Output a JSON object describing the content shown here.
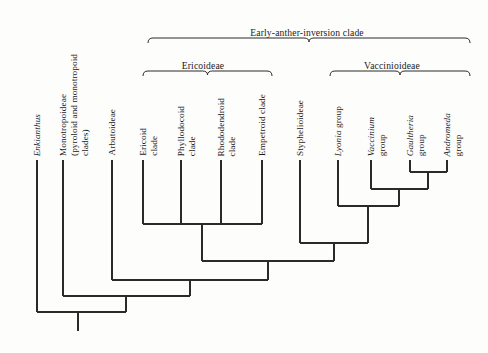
{
  "figure": {
    "kind": "cladogram",
    "background_color": "#fdfdfc",
    "line_color": "#2a2a2a",
    "text_color": "#1a1a1a",
    "width": 488,
    "height": 353
  },
  "clade_brackets": [
    {
      "id": "early-anther-inversion-clade",
      "label": "Early-anther-inversion clade",
      "label_x": 307,
      "label_y": 27,
      "bracket_left": 148,
      "bracket_right": 470,
      "bracket_y": 38,
      "bracket_depth": 5
    },
    {
      "id": "ericoideae",
      "label": "Ericoideae",
      "label_x": 203,
      "label_y": 60,
      "bracket_left": 143,
      "bracket_right": 272,
      "bracket_y": 71,
      "bracket_depth": 5
    },
    {
      "id": "vaccinioideae",
      "label": "Vaccinioideae",
      "label_x": 392,
      "label_y": 60,
      "bracket_left": 330,
      "bracket_right": 470,
      "bracket_y": 71,
      "bracket_depth": 5
    }
  ],
  "tips": [
    {
      "id": "enkianthus",
      "label": "Enkianthus",
      "italic": true,
      "x": 37,
      "label_bottom": 156,
      "lines": [
        "Enkianthus"
      ]
    },
    {
      "id": "monotropoideae",
      "label": "Monotropoideae (pyroloid and monotropoid clades)",
      "italic": false,
      "x": 63,
      "label_bottom": 156,
      "lines": [
        "Monotropoideae",
        "(pyroloid and monotropoid",
        "clades)"
      ]
    },
    {
      "id": "arbutoideae",
      "label": "Arbutoideae",
      "italic": false,
      "x": 112,
      "label_bottom": 156,
      "lines": [
        "Arbutoideae"
      ]
    },
    {
      "id": "ericoid-clade",
      "label": "Ericoid clade",
      "italic": false,
      "x": 143,
      "label_bottom": 156,
      "lines": [
        "Ericoid",
        "clade"
      ]
    },
    {
      "id": "phyllodocoid-clade",
      "label": "Phyllodocoid clade",
      "italic": false,
      "x": 181,
      "label_bottom": 156,
      "lines": [
        "Phyllodocoid",
        "clade"
      ]
    },
    {
      "id": "rhododendroid-clade",
      "label": "Rhododendroid clade",
      "italic": false,
      "x": 221,
      "label_bottom": 156,
      "lines": [
        "Rhododendroid",
        "clade"
      ]
    },
    {
      "id": "empetroid-clade",
      "label": "Empetroid clade",
      "italic": false,
      "x": 262,
      "label_bottom": 156,
      "lines": [
        "Empetroid clade"
      ]
    },
    {
      "id": "styphelioideae",
      "label": "Styphelioideae",
      "italic": false,
      "x": 300,
      "label_bottom": 156,
      "lines": [
        "Styphelioideae"
      ]
    },
    {
      "id": "lyonia-group",
      "label": "Lyonia group",
      "italic": false,
      "italic_prefix": "Lyonia",
      "x": 338,
      "label_bottom": 156,
      "lines": [
        "Lyonia group"
      ]
    },
    {
      "id": "vaccinium-group",
      "label": "Vaccinium group",
      "italic": false,
      "italic_prefix": "Vaccinium",
      "x": 371,
      "label_bottom": 156,
      "lines": [
        "Vaccinium",
        "group"
      ]
    },
    {
      "id": "gaultheria-group",
      "label": "Gaultheria group",
      "italic": false,
      "italic_prefix": "Gaultheria",
      "x": 410,
      "label_bottom": 156,
      "lines": [
        "Gaultheria",
        "group"
      ]
    },
    {
      "id": "andromeda-group",
      "label": "Andromeda group",
      "italic": false,
      "italic_prefix": "Andromeda",
      "x": 447,
      "label_bottom": 156,
      "lines": [
        "Andromeda",
        "group"
      ]
    }
  ],
  "nodes": [
    {
      "id": "node-gaultheria-andromeda",
      "children_x": [
        410,
        447
      ],
      "join_y": 172,
      "stem_x": 428,
      "stem_to_y": 189,
      "tip_top_y": 160
    },
    {
      "id": "node-vaccinium-plus",
      "children_x": [
        371,
        428
      ],
      "join_y": 189,
      "stem_x": 399,
      "stem_to_y": 206,
      "tip_top_y": 160
    },
    {
      "id": "node-lyonia-plus",
      "children_x": [
        338,
        399
      ],
      "join_y": 206,
      "stem_x": 368,
      "stem_to_y": 224,
      "tip_top_y": 160
    },
    {
      "id": "node-ericoideae-polytomy",
      "children_x": [
        143,
        181,
        221,
        262
      ],
      "join_y": 224,
      "stem_x": 202,
      "stem_to_y": 243,
      "tip_top_y": 160
    },
    {
      "id": "node-styphelioideae-vaccinioideae",
      "children_x": [
        300,
        368
      ],
      "join_y": 243,
      "stem_x": 334,
      "stem_to_y": 261,
      "tip_top_y": 160
    },
    {
      "id": "node-early-anther-inversion",
      "children_x": [
        202,
        334
      ],
      "join_y": 261,
      "stem_x": 268,
      "stem_to_y": 280,
      "tip_top_y": 160
    },
    {
      "id": "node-arbutoideae-plus",
      "children_x": [
        112,
        268
      ],
      "join_y": 280,
      "stem_x": 190,
      "stem_to_y": 296,
      "tip_top_y": 160
    },
    {
      "id": "node-monotropoideae-plus",
      "children_x": [
        63,
        190
      ],
      "join_y": 296,
      "stem_x": 126,
      "stem_to_y": 312,
      "tip_top_y": 160
    },
    {
      "id": "node-root",
      "children_x": [
        37,
        126
      ],
      "join_y": 312,
      "stem_x": 78,
      "stem_to_y": 331,
      "tip_top_y": 160
    }
  ],
  "root": {
    "x": 78,
    "top_y": 312,
    "bottom_y": 331
  }
}
